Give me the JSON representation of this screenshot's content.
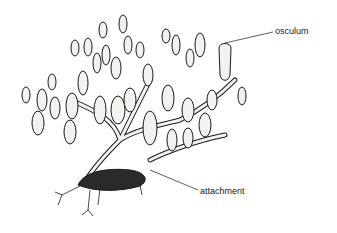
{
  "diagram": {
    "colors": {
      "ink": "#1a1a1a",
      "background": "#ffffff",
      "body_fill": "#f4f2ee"
    },
    "labels": [
      {
        "id": "osculum",
        "text": "osculum"
      },
      {
        "id": "attachment",
        "text": "attachment"
      }
    ]
  }
}
